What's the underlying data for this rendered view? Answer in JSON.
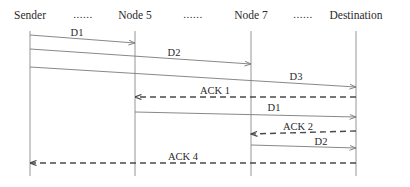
{
  "diagram": {
    "type": "sequence",
    "nodes": [
      {
        "id": "sender",
        "label": "Sender",
        "x": 30
      },
      {
        "id": "node5",
        "label": "Node 5",
        "x": 135
      },
      {
        "id": "node7",
        "label": "Node 7",
        "x": 251
      },
      {
        "id": "destination",
        "label": "Destination",
        "x": 356
      }
    ],
    "ellipses": [
      "......",
      "......",
      "......"
    ],
    "messages": [
      {
        "label": "D1",
        "from": "Sender",
        "to": "Node 5",
        "style": "solid"
      },
      {
        "label": "D2",
        "from": "Sender",
        "to": "Node 7",
        "style": "solid"
      },
      {
        "label": "D3",
        "from": "Sender",
        "to": "Destination",
        "style": "solid"
      },
      {
        "label": "ACK 1",
        "from": "Destination",
        "to": "Node 5",
        "style": "dashed"
      },
      {
        "label": "D1",
        "from": "Node 5",
        "to": "Destination",
        "style": "solid"
      },
      {
        "label": "ACK 2",
        "from": "Destination",
        "to": "Node 7",
        "style": "dashed"
      },
      {
        "label": "D2",
        "from": "Node 7",
        "to": "Destination",
        "style": "solid"
      },
      {
        "label": "ACK 4",
        "from": "Destination",
        "to": "Sender",
        "style": "dashed"
      }
    ],
    "colors": {
      "solid_line": "#7a7a7a",
      "dashed_line": "#4a4a4a",
      "lifeline": "#8a8a8a",
      "text": "#2a2a2a"
    }
  }
}
